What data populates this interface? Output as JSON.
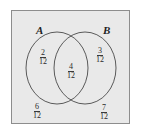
{
  "figure": {
    "type": "venn-diagram",
    "universe_border_color": "#8d8d8d",
    "universe_fill_color": "#e9e9e9",
    "circle_stroke_color": "#4a4a4a",
    "text_color": "#2a2a2a",
    "labels": {
      "set_a": "A",
      "set_b": "B"
    },
    "regions": {
      "a_only": {
        "numerator": "2",
        "denominator": "12"
      },
      "intersection": {
        "numerator": "4",
        "denominator": "12"
      },
      "b_only": {
        "numerator": "3",
        "denominator": "12"
      },
      "a_total": {
        "numerator": "6",
        "denominator": "12"
      },
      "b_total": {
        "numerator": "7",
        "denominator": "12"
      }
    }
  }
}
